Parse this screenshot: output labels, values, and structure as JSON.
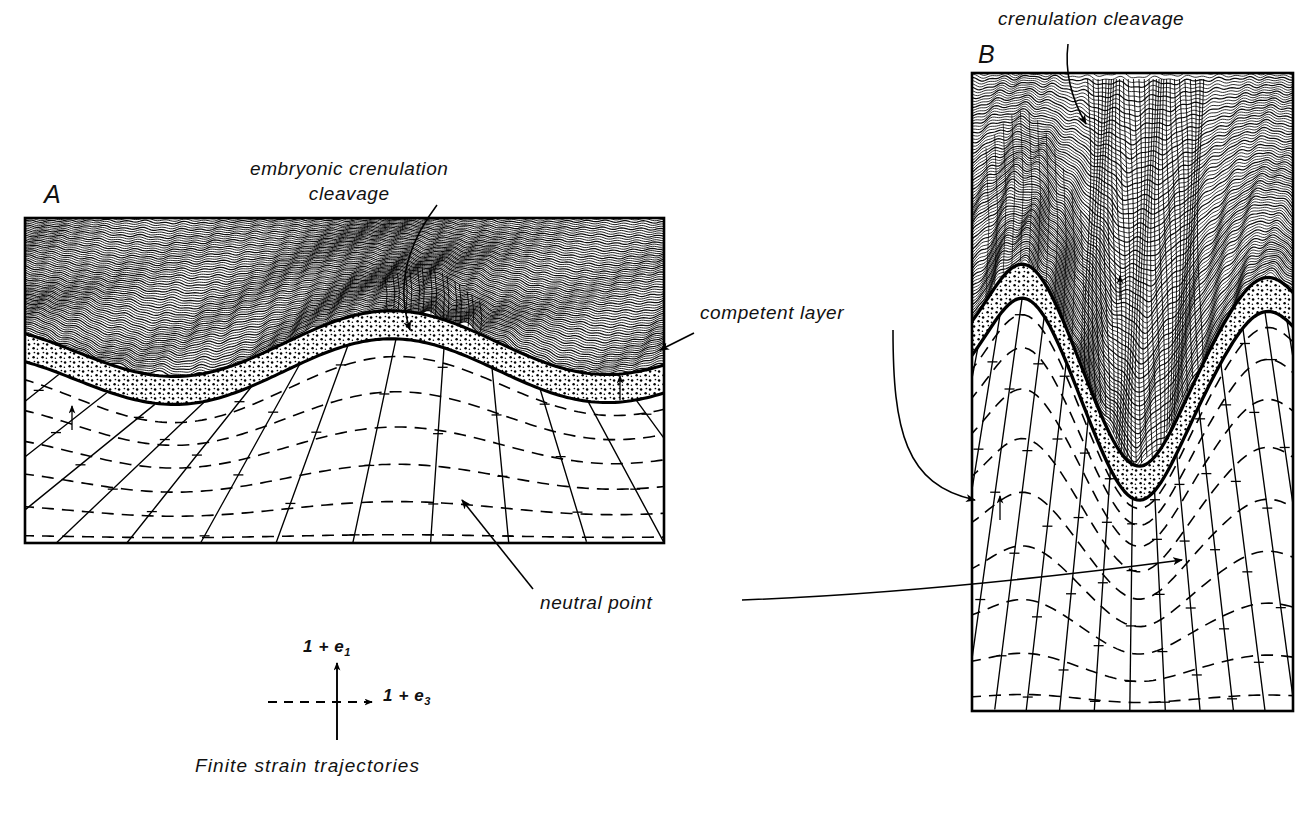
{
  "figure": {
    "type": "geological-cross-section-diagram",
    "title_visible": false,
    "background_color": "#ffffff",
    "ink_color": "#000000"
  },
  "panels": [
    {
      "id": "A",
      "label": "A",
      "label_pos": {
        "x": 44,
        "y": 180
      },
      "box": {
        "x": 25,
        "y": 218,
        "w": 639,
        "h": 325
      },
      "description": "Early stage: gentle buckle fold of competent layer with embryonic crenulation cleavage in the overlying foliated incompetent rock and a finite strain trajectory net below."
    },
    {
      "id": "B",
      "label": "B",
      "label_pos": {
        "x": 978,
        "y": 40
      },
      "box": {
        "x": 972,
        "y": 73,
        "w": 321,
        "h": 638
      },
      "description": "Advanced stage: tight fold with well developed crenulation cleavage concentrated in the fold core and strongly deformed finite strain trajectories."
    }
  ],
  "annotations": [
    {
      "name": "embryonic-crenulation-cleavage",
      "lines": [
        "embryonic  crenulation",
        "cleavage"
      ],
      "x": 250,
      "y": 158,
      "align": "left",
      "leader": {
        "from": [
          437,
          205
        ],
        "to": [
          410,
          330
        ],
        "arrow": true,
        "curved": true
      }
    },
    {
      "name": "crenulation-cleavage",
      "lines": [
        "crenulation  cleavage"
      ],
      "x": 998,
      "y": 8,
      "align": "left",
      "leader": {
        "from": [
          1068,
          44
        ],
        "to": [
          1086,
          124
        ],
        "arrow": true,
        "curved": true
      }
    },
    {
      "name": "competent-layer",
      "lines": [
        "competent   layer"
      ],
      "x": 700,
      "y": 302,
      "align": "left",
      "leader": {
        "from": [
          694,
          333
        ],
        "to": [
          660,
          350
        ],
        "arrow": true,
        "curved": false
      },
      "leader2": {
        "from": [
          893,
          330
        ],
        "to": [
          975,
          498
        ],
        "arrow": true,
        "curved": true
      }
    },
    {
      "name": "neutral-point",
      "lines": [
        "neutral   point"
      ],
      "x": 540,
      "y": 592,
      "align": "left",
      "leader": {
        "from": [
          533,
          589
        ],
        "to": [
          462,
          500
        ],
        "arrow": true,
        "curved": false
      },
      "leader2": {
        "from": [
          740,
          598
        ],
        "to": [
          1182,
          561
        ],
        "arrow": true,
        "curved": true
      }
    }
  ],
  "legend": {
    "name": "finite-strain-trajectories-key",
    "caption": "Finite   strain   trajectories",
    "caption_x": 195,
    "caption_y": 755,
    "axes": [
      {
        "name": "long-axis",
        "label_text": "1 + e",
        "label_sub": "1",
        "label_x": 303,
        "label_y": 637,
        "style": "solid",
        "direction": "vertical",
        "from": [
          337,
          740
        ],
        "to": [
          337,
          663
        ]
      },
      {
        "name": "short-axis",
        "label_text": "1 + e",
        "label_sub": "3",
        "label_x": 383,
        "label_y": 686,
        "style": "dashed",
        "direction": "horizontal",
        "from": [
          268,
          702
        ],
        "to": [
          372,
          702
        ]
      }
    ]
  },
  "line_styles": {
    "solid_trajectory": "1 + e1 principal finite strain direction (solid curves)",
    "dashed_trajectory": "1 + e3 principal finite strain direction (dashed curves)",
    "foliation": "wavy crenulated foliation traces",
    "competent_layer_fill": "stipple / dot ornament",
    "panel_border": "solid black rectangle"
  }
}
